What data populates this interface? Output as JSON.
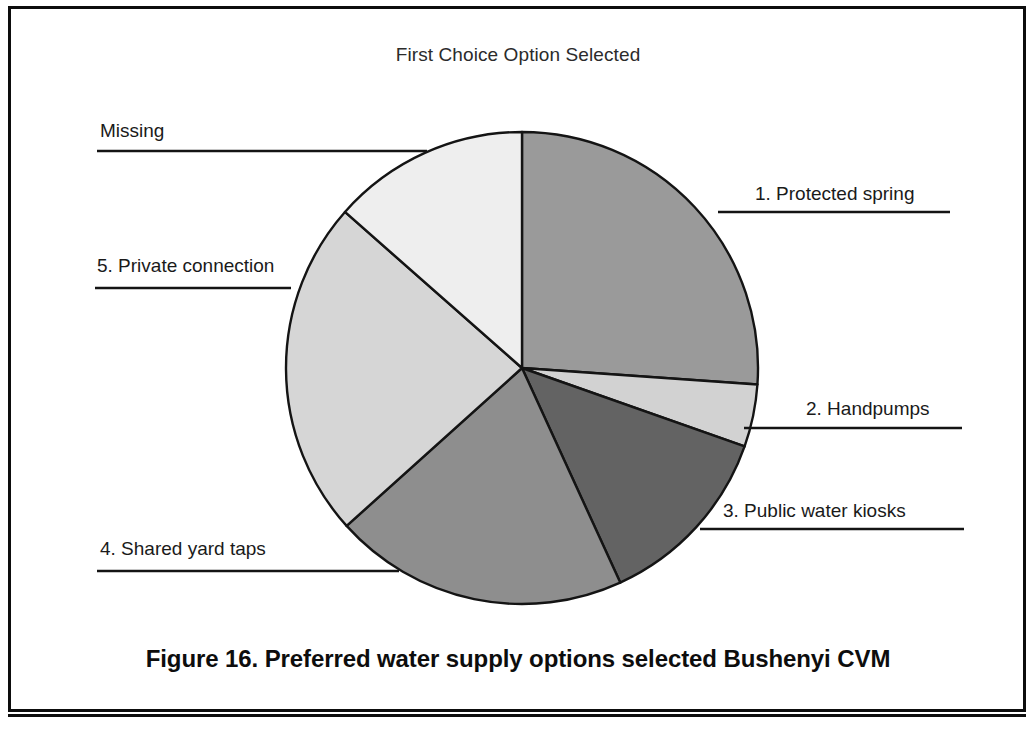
{
  "figure": {
    "caption": "Figure 16. Preferred water supply options selected Bushenyi CVM"
  },
  "chart_data": {
    "type": "pie",
    "title": "First Choice Option Selected",
    "xlabel": "",
    "ylabel": "",
    "legend_position": "callout-labels",
    "grid": false,
    "units": "percent",
    "categories": [
      "1. Protected spring",
      "2. Handpumps",
      "3. Public water kiosks",
      "4. Shared yard taps",
      "5. Private connection",
      "Missing"
    ],
    "values": [
      26.1,
      4.3,
      12.8,
      20.2,
      23.2,
      13.4
    ],
    "start_angle_deg": 0,
    "direction": "clockwise",
    "slices": [
      {
        "label": "1. Protected spring",
        "value": 26.1,
        "start_deg": 0,
        "end_deg": 94,
        "color": "#9a9a9a",
        "callout_side": "right",
        "callout_x": 755,
        "callout_y": 183,
        "leader_y": 212,
        "leader_x1": 718,
        "leader_x2": 950
      },
      {
        "label": "2. Handpumps",
        "value": 4.3,
        "start_deg": 94,
        "end_deg": 109.4,
        "color": "#d2d2d2",
        "callout_side": "right",
        "callout_x": 806,
        "callout_y": 398,
        "leader_y": 428,
        "leader_x1": 744,
        "leader_x2": 962
      },
      {
        "label": "3. Public water kiosks",
        "value": 12.8,
        "start_deg": 109.4,
        "end_deg": 155.4,
        "color": "#636363",
        "callout_side": "right",
        "callout_x": 723,
        "callout_y": 500,
        "leader_y": 529,
        "leader_x1": 700,
        "leader_x2": 964
      },
      {
        "label": "4. Shared yard taps",
        "value": 20.2,
        "start_deg": 155.4,
        "end_deg": 228,
        "color": "#8e8e8e",
        "callout_side": "left",
        "callout_x": 100,
        "callout_y": 538,
        "leader_y": 571,
        "leader_x1": 97,
        "leader_x2": 399
      },
      {
        "label": "5. Private connection",
        "value": 23.2,
        "start_deg": 228,
        "end_deg": 311.4,
        "color": "#d6d6d6",
        "callout_side": "left",
        "callout_x": 97,
        "callout_y": 255,
        "leader_y": 288,
        "leader_x1": 95,
        "leader_x2": 291
      },
      {
        "label": "Missing",
        "value": 13.4,
        "start_deg": 311.4,
        "end_deg": 360,
        "color": "#eeeeee",
        "callout_side": "left",
        "callout_x": 100,
        "callout_y": 120,
        "leader_y": 151,
        "leader_x1": 97,
        "leader_x2": 427
      }
    ],
    "geometry": {
      "center_x": 522,
      "center_y": 368,
      "radius": 236
    }
  }
}
